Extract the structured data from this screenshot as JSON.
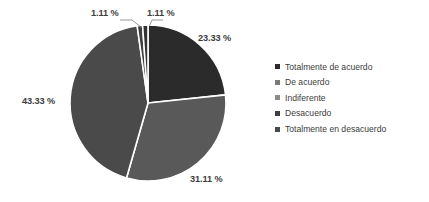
{
  "chart_data": {
    "type": "pie",
    "title": "",
    "xlabel": "",
    "ylabel": "",
    "legend_position": "right",
    "grid": false,
    "start_angle_deg": 0,
    "direction": "clockwise",
    "categories": [
      "Totalmente de acuerdo",
      "De acuerdo",
      "Indiferente",
      "Desacuerdo",
      "Totalmente en desacuerdo"
    ],
    "values": [
      23.33,
      31.11,
      43.33,
      1.11,
      1.11
    ],
    "value_unit": "%",
    "data_labels": [
      "23.33 %",
      "31.11 %",
      "43.33 %",
      "1.11 %",
      "1.11 %"
    ],
    "colors": [
      "#2b2b2b",
      "#595959",
      "#4a4a4a",
      "#3f3f3f",
      "#333333"
    ],
    "slice_border_color": "#ffffff"
  },
  "labels": {
    "totalmente_de_acuerdo": "23.33 %",
    "de_acuerdo": "31.11 %",
    "indiferente": "43.33 %",
    "desacuerdo": "1.11 %",
    "totalmente_en_desacuerdo": "1.11 %"
  },
  "legend": {
    "items": [
      {
        "label": "Totalmente de acuerdo",
        "color": "#2b2b2b"
      },
      {
        "label": "De acuerdo",
        "color": "#7a7a7a"
      },
      {
        "label": "Indiferente",
        "color": "#8c8c8c"
      },
      {
        "label": "Desacuerdo",
        "color": "#3f3f3f"
      },
      {
        "label": "Totalmente en desacuerdo",
        "color": "#4a4a4a"
      }
    ]
  },
  "geometry": {
    "center_x": 148,
    "center_y": 103,
    "radius": 78
  }
}
